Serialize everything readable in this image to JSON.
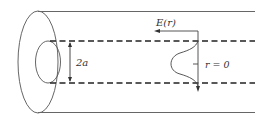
{
  "diagram": {
    "labels": {
      "core_diameter": "2a",
      "field": "E(r)",
      "axis": "r = 0"
    },
    "colors": {
      "line": "#555555",
      "dash": "#222222",
      "text": "#333333",
      "background": "#ffffff"
    }
  }
}
